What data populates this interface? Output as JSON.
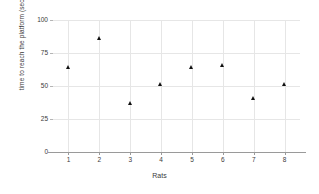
{
  "chart_data": {
    "type": "scatter",
    "title": "",
    "xlabel": "Rats",
    "ylabel": "time to reach the platform (seconds)",
    "x": [
      1,
      2,
      3,
      4,
      5,
      6,
      7,
      8
    ],
    "values": [
      64,
      86,
      37,
      51,
      64,
      66,
      41,
      51
    ],
    "xtick_labels": [
      "1",
      "2",
      "3",
      "4",
      "5",
      "6",
      "7",
      "8"
    ],
    "ytick_labels": [
      "0",
      "25",
      "50",
      "75",
      "100"
    ],
    "yticks": [
      0,
      25,
      50,
      75,
      100
    ],
    "xlim": [
      0.5,
      8.5
    ],
    "ylim": [
      0,
      100
    ],
    "grid": true,
    "legend": false,
    "marker": "triangle",
    "marker_color": "#101010",
    "grid_color": "#e6e6e6",
    "axis_color": "#9a9a9a",
    "background": "#ffffff"
  }
}
